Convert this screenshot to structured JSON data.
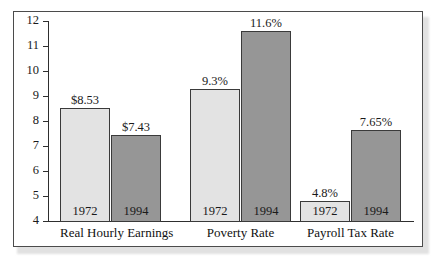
{
  "chart_data": {
    "type": "bar",
    "title": "",
    "subtitle": "",
    "xlabel": "",
    "ylabel": "",
    "ylim": [
      4,
      12
    ],
    "grid": false,
    "legend_position": "none",
    "categories": [
      "Real Hourly Earnings",
      "Poverty Rate",
      "Payroll Tax Rate"
    ],
    "y_ticks": [
      "12",
      "11",
      "10",
      "9",
      "8",
      "7",
      "6",
      "5",
      "4"
    ],
    "series": [
      {
        "name": "1972",
        "values": [
          8.53,
          9.3,
          4.8
        ],
        "labels": [
          "$8.53",
          "9.3%",
          "4.8%"
        ],
        "color": "#e3e3e3"
      },
      {
        "name": "1994",
        "values": [
          7.43,
          11.6,
          7.65
        ],
        "labels": [
          "$7.43",
          "11.6%",
          "7.65%"
        ],
        "color": "#969696"
      }
    ],
    "groups": [
      {
        "label": "Real Hourly Earnings",
        "bars": [
          {
            "year": "1972",
            "value": 8.53,
            "label": "$8.53",
            "shade": "light"
          },
          {
            "year": "1994",
            "value": 7.43,
            "label": "$7.43",
            "shade": "dark"
          }
        ]
      },
      {
        "label": "Poverty Rate",
        "bars": [
          {
            "year": "1972",
            "value": 9.3,
            "label": "9.3%",
            "shade": "light"
          },
          {
            "year": "1994",
            "value": 11.6,
            "label": "11.6%",
            "shade": "dark"
          }
        ]
      },
      {
        "label": "Payroll Tax Rate",
        "bars": [
          {
            "year": "1972",
            "value": 4.8,
            "label": "4.8%",
            "shade": "light"
          },
          {
            "year": "1994",
            "value": 7.65,
            "label": "7.65%",
            "shade": "dark"
          }
        ]
      }
    ],
    "colors": {
      "light_bar": "#e3e3e3",
      "dark_bar": "#969696",
      "bar_outline": "#3a3a3a",
      "axis": "#2e2e2e",
      "frame": "#4b4b4b",
      "text": "#1a1a1a",
      "background": "#ffffff"
    }
  }
}
